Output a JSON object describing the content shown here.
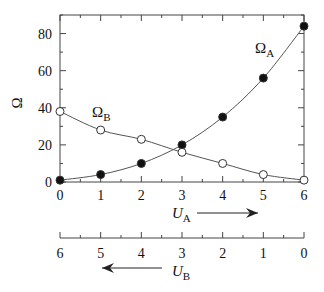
{
  "chart_data": {
    "type": "line",
    "title": "",
    "ylabel": "Ω",
    "xlabel_top": "U_A",
    "xlabel_bottom": "U_B",
    "x": [
      0,
      1,
      2,
      3,
      4,
      5,
      6
    ],
    "x_tick_labels_top": [
      "0",
      "1",
      "2",
      "3",
      "4",
      "5",
      "6"
    ],
    "x_tick_labels_bottom": [
      "6",
      "5",
      "4",
      "3",
      "2",
      "1",
      "0"
    ],
    "y_tick_labels": [
      "0",
      "20",
      "40",
      "60",
      "80"
    ],
    "ylim": [
      0,
      90
    ],
    "xlim": [
      0,
      6
    ],
    "grid": false,
    "legend": "inline labels",
    "series": [
      {
        "name": "Ω_A",
        "label_main": "Ω",
        "label_sub": "A",
        "marker": "filled-circle",
        "values": [
          1,
          4,
          10,
          20,
          35,
          56,
          84
        ]
      },
      {
        "name": "Ω_B",
        "label_main": "Ω",
        "label_sub": "B",
        "marker": "open-circle",
        "values": [
          38,
          28,
          23,
          16,
          10,
          4,
          1
        ]
      }
    ],
    "annotations": [
      {
        "text": "U_A →",
        "meaning": "U_A increases to the right"
      },
      {
        "text": "← U_B",
        "meaning": "U_B increases to the left"
      }
    ]
  },
  "labels": {
    "y_axis": "Ω",
    "omega_a_main": "Ω",
    "omega_a_sub": "A",
    "omega_b_main": "Ω",
    "omega_b_sub": "B",
    "ua_main": "U",
    "ua_sub": "A",
    "ub_main": "U",
    "ub_sub": "B"
  }
}
